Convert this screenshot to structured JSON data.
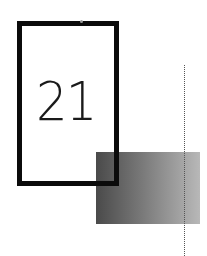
{
  "card": {
    "number": "21"
  },
  "colors": {
    "frame": "#0b0b0b",
    "gradient_start": "#4a4a4a",
    "gradient_end": "#b8b8b8",
    "dotted_line": "#555555",
    "background": "#ffffff"
  }
}
